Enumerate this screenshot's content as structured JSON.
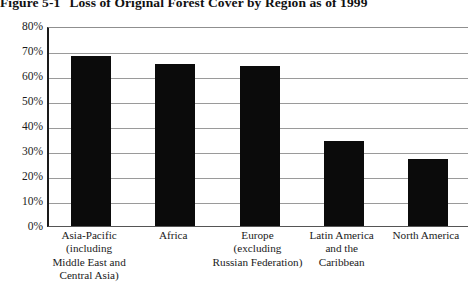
{
  "title": {
    "figure_number": "Figure 5-1",
    "text": "Loss of Original Forest Cover by Region as of 1999"
  },
  "chart_data": {
    "type": "bar",
    "title": "Loss of Original Forest Cover by Region as of 1999",
    "xlabel": "",
    "ylabel": "",
    "ylim": [
      0,
      80
    ],
    "ytick_labels": [
      "80%",
      "70%",
      "60%",
      "50%",
      "40%",
      "30%",
      "20%",
      "10%",
      "0%"
    ],
    "ytick_values": [
      80,
      70,
      60,
      50,
      40,
      30,
      20,
      10,
      0
    ],
    "grid": true,
    "legend": false,
    "bar_color": "#0b0b0b",
    "categories": [
      "Asia-Pacific (including Middle East and Central Asia)",
      "Africa",
      "Europe (excluding Russian Federation)",
      "Latin America and the Caribbean",
      "North America"
    ],
    "category_lines": [
      [
        "Asia-Pacific",
        "(including",
        "Middle East and",
        "Central Asia)"
      ],
      [
        "Africa"
      ],
      [
        "Europe",
        "(excluding",
        "Russian Federation)"
      ],
      [
        "Latin America",
        "and the",
        "Caribbean"
      ],
      [
        "North America"
      ]
    ],
    "values": [
      68,
      65,
      64,
      34,
      27
    ]
  }
}
